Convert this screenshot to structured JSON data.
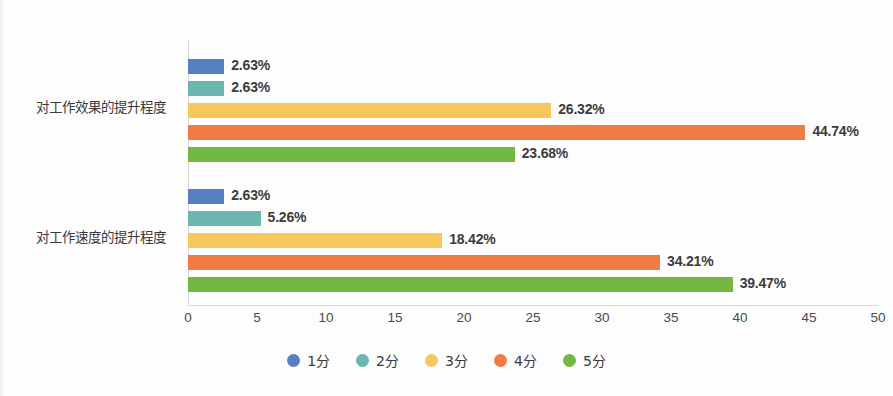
{
  "chart_data": {
    "type": "bar",
    "orientation": "horizontal",
    "title": "",
    "xlabel": "",
    "ylabel": "",
    "xlim": [
      0,
      50
    ],
    "xticks": [
      "0",
      "5",
      "10",
      "15",
      "20",
      "25",
      "30",
      "35",
      "40",
      "45",
      "50"
    ],
    "grid": false,
    "legend_position": "bottom",
    "value_suffix": "%",
    "categories": [
      "对工作效果的提升程度",
      "对工作速度的提升程度"
    ],
    "series": [
      {
        "name": "1分",
        "color": "#5680c0",
        "values": [
          2.63,
          2.63
        ],
        "labels": [
          "2.63%",
          "2.63%"
        ]
      },
      {
        "name": "2分",
        "color": "#6bb6ae",
        "values": [
          2.63,
          5.26
        ],
        "labels": [
          "2.63%",
          "5.26%"
        ]
      },
      {
        "name": "3分",
        "color": "#f5c75c",
        "values": [
          26.32,
          18.42
        ],
        "labels": [
          "26.32%",
          "18.42%"
        ]
      },
      {
        "name": "4分",
        "color": "#f07c43",
        "values": [
          44.74,
          34.21
        ],
        "labels": [
          "44.74%",
          "34.21%"
        ]
      },
      {
        "name": "5分",
        "color": "#73b842",
        "values": [
          23.68,
          39.47
        ],
        "labels": [
          "23.68%",
          "39.47%"
        ]
      }
    ]
  }
}
